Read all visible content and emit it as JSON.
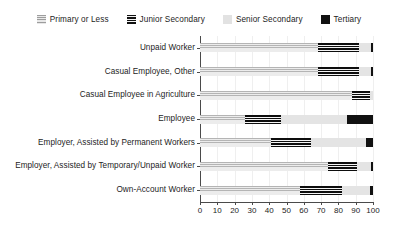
{
  "chart_data": {
    "type": "bar",
    "orientation": "horizontal",
    "stacked": true,
    "stack_mode": "percent",
    "title": "",
    "xlabel": "",
    "ylabel": "",
    "xlim": [
      0,
      100
    ],
    "xticks": [
      0,
      10,
      20,
      30,
      40,
      50,
      60,
      70,
      80,
      90,
      100
    ],
    "xticklabels": [
      "0",
      "10",
      "20",
      "30",
      "40",
      "50",
      "60",
      "70",
      "80",
      "90",
      "100"
    ],
    "grid": true,
    "legend_position": "top",
    "categories": [
      "Unpaid Worker",
      "Casual Employee, Other",
      "Casual Employee in Agriculture",
      "Employee",
      "Employer, Assisted by Permanent Workers",
      "Employer, Assisted by Temporary/Unpaid Worker",
      "Own-Account Worker"
    ],
    "series": [
      {
        "name": "Primary or Less",
        "color": "#e6e6e6",
        "pattern": "light-horizontal-stripes",
        "values": [
          68,
          68,
          88,
          26,
          41,
          74,
          58
        ]
      },
      {
        "name": "Junior Secondary",
        "color": "#141414",
        "pattern": "dark-horizontal-stripes",
        "values": [
          24,
          24,
          10,
          21,
          23,
          17,
          24
        ]
      },
      {
        "name": "Senior Secondary",
        "color": "#e4e4e4",
        "pattern": "solid",
        "values": [
          7,
          7,
          2,
          38,
          32,
          8,
          16
        ]
      },
      {
        "name": "Tertiary",
        "color": "#111111",
        "pattern": "solid",
        "values": [
          1,
          1,
          0,
          15,
          4,
          1,
          2
        ]
      }
    ]
  },
  "legend": {
    "items": [
      {
        "label": "Primary or Less",
        "swatch": "primary-swatch-icon"
      },
      {
        "label": "Junior Secondary",
        "swatch": "junior-swatch-icon"
      },
      {
        "label": "Senior Secondary",
        "swatch": "senior-swatch-icon"
      },
      {
        "label": "Tertiary",
        "swatch": "tertiary-swatch-icon"
      }
    ]
  }
}
